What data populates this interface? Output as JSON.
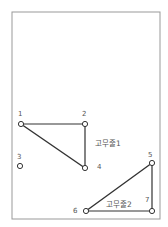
{
  "diagram": {
    "frame": {
      "x": 12,
      "y": 12,
      "width": 148,
      "height": 207,
      "stroke": "#999999"
    },
    "pegs": [
      {
        "id": "1",
        "label": "1",
        "x": 21,
        "y": 124
      },
      {
        "id": "2",
        "label": "2",
        "x": 85,
        "y": 124
      },
      {
        "id": "3",
        "label": "3",
        "x": 20,
        "y": 166
      },
      {
        "id": "4",
        "label": "4",
        "x": 85,
        "y": 168
      },
      {
        "id": "5",
        "label": "5",
        "x": 152,
        "y": 163
      },
      {
        "id": "6",
        "label": "6",
        "x": 86,
        "y": 211
      },
      {
        "id": "7",
        "label": "7",
        "x": 152,
        "y": 211
      }
    ],
    "rubber_bands": [
      {
        "name": "고무줄1",
        "pegs": [
          "1",
          "2",
          "4"
        ]
      },
      {
        "name": "고무줄2",
        "pegs": [
          "5",
          "7",
          "6"
        ]
      }
    ],
    "colors": {
      "line": "#333333",
      "peg": "#333333",
      "text": "#555555"
    }
  }
}
